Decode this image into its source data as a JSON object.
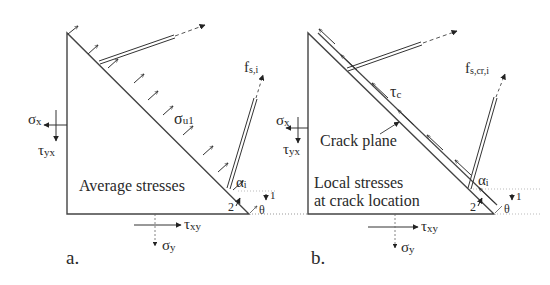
{
  "panels": [
    {
      "id": "a",
      "caption": "a.",
      "region_label": "Average stresses",
      "normal_stress_label": "σ",
      "normal_stress_sub": "u1",
      "bar_force_label": "f",
      "bar_force_sub": "s,i",
      "alpha_label": "α",
      "alpha_sub": "i",
      "axis_1": "1",
      "axis_2": "2",
      "theta": "θ",
      "sigma_x": "σ",
      "sigma_x_sub": "x",
      "tau_yx": "τ",
      "tau_yx_sub": "yx",
      "tau_xy": "τ",
      "tau_xy_sub": "xy",
      "sigma_y": "σ",
      "sigma_y_sub": "y"
    },
    {
      "id": "b",
      "caption": "b.",
      "region_label_line1": "Local stresses",
      "region_label_line2": "at crack location",
      "crack_label": "Crack plane",
      "shear_stress_label": "τ",
      "shear_stress_sub": "c",
      "bar_force_label": "f",
      "bar_force_sub": "s,cr,i",
      "alpha_label": "α",
      "alpha_sub": "i",
      "axis_1": "1",
      "axis_2": "2",
      "theta": "θ",
      "sigma_x": "σ",
      "sigma_x_sub": "x",
      "tau_yx": "τ",
      "tau_yx_sub": "yx",
      "tau_xy": "τ",
      "tau_xy_sub": "xy",
      "sigma_y": "σ",
      "sigma_y_sub": "y"
    }
  ]
}
